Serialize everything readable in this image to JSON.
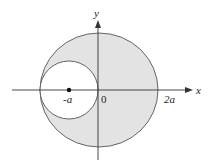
{
  "diagram": {
    "type": "region-between-circles",
    "colors": {
      "fill": "#e3e3e3",
      "stroke": "#555555",
      "axis": "#333333",
      "background": "#ffffff"
    },
    "axes": {
      "x_label": "x",
      "y_label": "y"
    },
    "tick_labels": {
      "neg_a": "-a",
      "origin": "0",
      "two_a": "2a"
    },
    "outer_circle": {
      "description": "large shaded circle from -2a to 2a on x-axis"
    },
    "inner_circle": {
      "description": "unshaded circle centered at -a, tangent to y-axis at origin",
      "center_label": "-a"
    }
  }
}
